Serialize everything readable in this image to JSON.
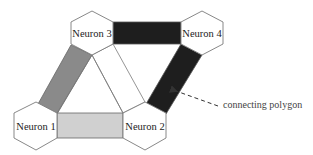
{
  "diagram": {
    "type": "neuron-connectivity",
    "neurons": [
      {
        "id": "n1",
        "label": "Neuron 1",
        "cx": 36,
        "cy": 126,
        "r": 24
      },
      {
        "id": "n2",
        "label": "Neuron 2",
        "cx": 145,
        "cy": 126,
        "r": 24
      },
      {
        "id": "n3",
        "label": "Neuron 3",
        "cx": 92,
        "cy": 33,
        "r": 22
      },
      {
        "id": "n4",
        "label": "Neuron 4",
        "cx": 202,
        "cy": 33,
        "r": 22
      }
    ],
    "connections": [
      {
        "from": "n3",
        "to": "n4",
        "fill": "#1e1e1e"
      },
      {
        "from": "n1",
        "to": "n3",
        "fill": "#8a8a8a"
      },
      {
        "from": "n1",
        "to": "n2",
        "fill": "#d0d0d0"
      },
      {
        "from": "n4",
        "to": "n2",
        "fill": "#1e1e1e"
      },
      {
        "from": "n3",
        "to": "n2",
        "fill": "#ffffff"
      }
    ],
    "annotation": {
      "label": "connecting polygon",
      "points_to": "n4-n2 connection"
    },
    "colors": {
      "stroke": "#7a7a7a",
      "dark_polygon": "#1e1e1e",
      "mid_polygon": "#8a8a8a",
      "light_polygon": "#d0d0d0",
      "hexagon_fill": "#ffffff"
    }
  }
}
